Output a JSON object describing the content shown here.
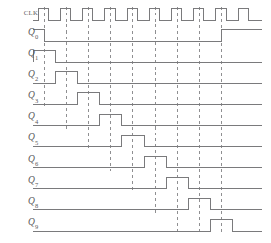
{
  "figure": {
    "kind": "digital-timing-diagram",
    "background_color": "#ffffff",
    "wave_color": "#7a7a7c",
    "dash_color": "#8f8f91",
    "label_color": "#58585a"
  },
  "axis": {
    "label_right_edge_px": 38,
    "wave_start_px": 33,
    "wave_end_px": 262,
    "first_edge_px": 44,
    "edge_pitch_px": 22.2,
    "edge_count": 9,
    "row_start_py": 20,
    "row_pitch_py": 21.1,
    "wave_amplitude_px": 11.5
  },
  "signals": [
    {
      "name": "CLK",
      "label": "CLK",
      "label_kind": "plain",
      "subscript": "",
      "row": 0,
      "type": "clock",
      "pulses": 10,
      "initial_level": "low",
      "description": "Ten clock pulses; rising edges align with the dashed grid lines"
    },
    {
      "name": "Q0",
      "label": "Q",
      "label_kind": "sub",
      "subscript": "0",
      "row": 1,
      "type": "data",
      "initial_level": "high",
      "transitions": [
        {
          "at_edge": 0,
          "to": "low"
        },
        {
          "at_edge": 8,
          "to": "high"
        }
      ],
      "description": "High before the first clock edge, low through the count, high again after edge 8"
    },
    {
      "name": "Q1",
      "label": "Q",
      "label_kind": "sub",
      "subscript": "1",
      "row": 2,
      "type": "data",
      "initial_level": "low",
      "pulse_start_edge": 0,
      "pulse_end_edge": 1,
      "pulse_lead_px": 11,
      "description": "Single high interval spanning clock period 1"
    },
    {
      "name": "Q2",
      "label": "Q",
      "label_kind": "sub",
      "subscript": "2",
      "row": 3,
      "type": "data",
      "initial_level": "low",
      "pulse_start_edge": 1,
      "pulse_end_edge": 2,
      "pulse_lead_px": 11,
      "description": "Single high interval spanning clock period 2"
    },
    {
      "name": "Q3",
      "label": "Q",
      "label_kind": "sub",
      "subscript": "3",
      "row": 4,
      "type": "data",
      "initial_level": "low",
      "pulse_start_edge": 2,
      "pulse_end_edge": 3,
      "pulse_lead_px": 11,
      "description": "Single high interval spanning clock period 3"
    },
    {
      "name": "Q4",
      "label": "Q",
      "label_kind": "sub",
      "subscript": "4",
      "row": 5,
      "type": "data",
      "initial_level": "low",
      "pulse_start_edge": 3,
      "pulse_end_edge": 4,
      "pulse_lead_px": 11,
      "description": "Single high interval spanning clock period 4"
    },
    {
      "name": "Q5",
      "label": "Q",
      "label_kind": "sub",
      "subscript": "5",
      "row": 6,
      "type": "data",
      "initial_level": "low",
      "pulse_start_edge": 4,
      "pulse_end_edge": 5,
      "pulse_lead_px": 11,
      "description": "Single high interval spanning clock period 5"
    },
    {
      "name": "Q6",
      "label": "Q",
      "label_kind": "sub",
      "subscript": "6",
      "row": 7,
      "type": "data",
      "initial_level": "low",
      "pulse_start_edge": 5,
      "pulse_end_edge": 6,
      "pulse_lead_px": 11,
      "description": "Single high interval spanning clock period 6"
    },
    {
      "name": "Q7",
      "label": "Q",
      "label_kind": "sub",
      "subscript": "7",
      "row": 8,
      "type": "data",
      "initial_level": "low",
      "pulse_start_edge": 6,
      "pulse_end_edge": 7,
      "pulse_lead_px": 11,
      "description": "Single high interval spanning clock period 7"
    },
    {
      "name": "Q8",
      "label": "Q",
      "label_kind": "sub",
      "subscript": "8",
      "row": 9,
      "type": "data",
      "initial_level": "low",
      "pulse_start_edge": 7,
      "pulse_end_edge": 8,
      "pulse_lead_px": 11,
      "description": "Single high interval spanning clock period 8"
    },
    {
      "name": "Q9",
      "label": "Q",
      "label_kind": "sub",
      "subscript": "9",
      "row": 10,
      "type": "data",
      "initial_level": "low",
      "pulse_start_edge": 8,
      "pulse_end_edge": 9,
      "pulse_lead_px": 11,
      "description": "Single high interval spanning clock period 9"
    }
  ],
  "grid": {
    "dashed_line_count": 9,
    "dash_pattern": "3 3",
    "description": "Dashed vertical markers drop from each clock rising edge down to the active row"
  }
}
